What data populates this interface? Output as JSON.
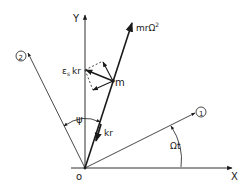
{
  "diagram": {
    "axes": {
      "x_label": "X",
      "y_label": "Y",
      "origin_label": "o"
    },
    "rotating_axes": {
      "axis1_label": "1",
      "axis2_label": "2"
    },
    "angles": {
      "rotation_angle": "Ωt",
      "psi": "ψ"
    },
    "forces": {
      "centrifugal": "mrΩ²",
      "centrifugal_base": "mrΩ",
      "centrifugal_sup": "2",
      "restoring": "kr",
      "damping": "kr",
      "damping_prefix": "ε",
      "damping_sub": "s"
    },
    "mass_label": "m",
    "colors": {
      "line": "#1a1a1a",
      "background": "#ffffff"
    }
  }
}
